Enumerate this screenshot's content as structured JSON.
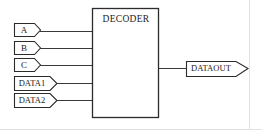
{
  "diagram": {
    "type": "block-diagram",
    "background_color": "#ffffff",
    "line_color": "#3a3a3a",
    "shape_stroke_color": "#2b2b2b",
    "shape_fill_color": "#ffffff",
    "text_color": "#1a1a1a",
    "block": {
      "label": "DECODER",
      "x": 92,
      "y": 8,
      "width": 67,
      "height": 110,
      "label_x": 126,
      "label_y": 19
    },
    "inputs": [
      {
        "label": "A",
        "wire_y": 31,
        "shape_x": 14,
        "shape_y": 23,
        "body_width": 20,
        "tip_width": 7,
        "height": 13,
        "label_size": "small"
      },
      {
        "label": "B",
        "wire_y": 48,
        "shape_x": 14,
        "shape_y": 41,
        "body_width": 20,
        "tip_width": 7,
        "height": 13,
        "label_size": "small"
      },
      {
        "label": "C",
        "wire_y": 65,
        "shape_x": 14,
        "shape_y": 58,
        "body_width": 20,
        "tip_width": 7,
        "height": 13,
        "label_size": "small"
      },
      {
        "label": "DATA1",
        "wire_y": 83,
        "shape_x": 14,
        "shape_y": 76,
        "body_width": 36,
        "tip_width": 8,
        "height": 14,
        "label_size": "normal"
      },
      {
        "label": "DATA2",
        "wire_y": 100,
        "shape_x": 14,
        "shape_y": 94,
        "body_width": 36,
        "tip_width": 8,
        "height": 14,
        "label_size": "normal"
      }
    ],
    "outputs": [
      {
        "label": "DATAOUT",
        "wire_y": 68,
        "shape_x": 186,
        "shape_y": 61,
        "body_width": 50,
        "tip_width": 12,
        "height": 15,
        "label_size": "normal"
      }
    ]
  }
}
